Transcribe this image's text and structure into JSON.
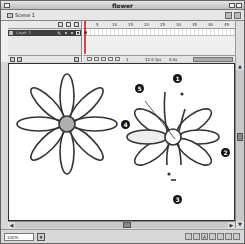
{
  "window": {
    "title": "flower"
  },
  "scene": {
    "name": "Scene 1"
  },
  "timeline": {
    "layer": {
      "name": "Layer 1"
    },
    "ruler_ticks": [
      "5",
      "10",
      "15",
      "20",
      "25",
      "30",
      "35",
      "40",
      "45"
    ],
    "status": {
      "frame": "1",
      "fps": "12.0 fps",
      "time": "0.0s"
    }
  },
  "bottombar": {
    "zoom": "100%"
  },
  "stage": {
    "callouts": [
      "1",
      "2",
      "3",
      "4",
      "5"
    ],
    "left_flower_center_color": "#b0b0b0",
    "outline_color": "#333333"
  }
}
